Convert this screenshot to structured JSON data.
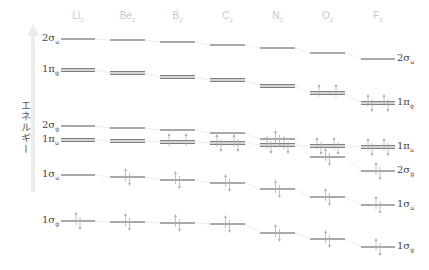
{
  "axis": {
    "label": "エネルギー",
    "arrow_color": "#e6e6e6"
  },
  "colors": {
    "level": "#555555",
    "connector": "#e8e8e8",
    "electron": "#b0b0b0",
    "header": "#c8c8c8"
  },
  "columns": [
    {
      "name": "Li",
      "sub": "2",
      "x0": 61,
      "x1": 95
    },
    {
      "name": "Be",
      "sub": "2",
      "x0": 110,
      "x1": 145
    },
    {
      "name": "B",
      "sub": "2",
      "x0": 160,
      "x1": 195
    },
    {
      "name": "C",
      "sub": "2",
      "x0": 210,
      "x1": 245
    },
    {
      "name": "N",
      "sub": "2",
      "x0": 260,
      "x1": 295
    },
    {
      "name": "O",
      "sub": "2",
      "x0": 310,
      "x1": 345
    },
    {
      "name": "F",
      "sub": "2",
      "x0": 361,
      "x1": 395
    }
  ],
  "orbitals": [
    {
      "id": "2su",
      "base": "2σ",
      "sub": "u",
      "double": false,
      "y": [
        39,
        40,
        42,
        45,
        48,
        53,
        59
      ],
      "electrons": [
        0,
        0,
        0,
        0,
        0,
        0,
        0
      ]
    },
    {
      "id": "1pg",
      "base": "1π",
      "sub": "g",
      "double": true,
      "y": [
        70,
        73,
        77,
        80,
        86,
        93,
        103
      ],
      "electrons": [
        0,
        0,
        0,
        0,
        0,
        2,
        4
      ]
    },
    {
      "id": "2sg",
      "base": "2σ",
      "sub": "g",
      "double": false,
      "y": [
        126,
        128,
        130,
        133,
        139,
        157,
        171
      ],
      "electrons": [
        0,
        0,
        0,
        0,
        2,
        2,
        2
      ]
    },
    {
      "id": "1pu",
      "base": "1π",
      "sub": "u",
      "double": true,
      "y": [
        140,
        141,
        142,
        143,
        145,
        146,
        147
      ],
      "electrons": [
        0,
        0,
        2,
        4,
        4,
        4,
        4
      ]
    },
    {
      "id": "1su",
      "base": "1σ",
      "sub": "u",
      "double": false,
      "y": [
        175,
        177,
        180,
        183,
        189,
        197,
        205
      ],
      "electrons": [
        0,
        2,
        2,
        2,
        2,
        2,
        2
      ]
    },
    {
      "id": "1sg",
      "base": "1σ",
      "sub": "g",
      "double": false,
      "y": [
        221,
        222,
        223,
        224,
        233,
        239,
        247
      ],
      "electrons": [
        2,
        2,
        2,
        2,
        2,
        2,
        2
      ]
    }
  ],
  "left_labels": [
    {
      "text": "2σ",
      "sub": "u",
      "y": 39
    },
    {
      "text": "1π",
      "sub": "g",
      "y": 70
    },
    {
      "text": "2σ",
      "sub": "g",
      "y": 126
    },
    {
      "text": "1π",
      "sub": "u",
      "y": 140
    },
    {
      "text": "1σ",
      "sub": "u",
      "y": 175
    },
    {
      "text": "1σ",
      "sub": "g",
      "y": 221
    }
  ],
  "right_labels": [
    {
      "text": "2σ",
      "sub": "u",
      "y": 59
    },
    {
      "text": "1π",
      "sub": "g",
      "y": 103
    },
    {
      "text": "1π",
      "sub": "u",
      "y": 147
    },
    {
      "text": "2σ",
      "sub": "g",
      "y": 171
    },
    {
      "text": "1σ",
      "sub": "u",
      "y": 205
    },
    {
      "text": "1σ",
      "sub": "g",
      "y": 247
    }
  ]
}
